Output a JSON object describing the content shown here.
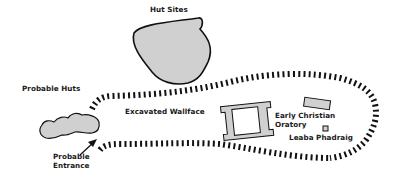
{
  "diagram": {
    "type": "site-plan",
    "colors": {
      "fill": "#d0d0d0",
      "stroke": "#111111",
      "wall_dash": "#111111",
      "background": "#ffffff"
    },
    "labels": {
      "hut_sites": "Hut Sites",
      "probable_huts": "Probable Huts",
      "excavated_wallface": "Excavated Wallface",
      "early_christian_oratory_line1": "Early Christian",
      "early_christian_oratory_line2": "Oratory",
      "leaba_phadraig": "Leaba Phadraig",
      "probable_entrance_line1": "Probable",
      "probable_entrance_line2": "Entrance"
    },
    "features": [
      {
        "name": "hut-sites",
        "shape": "blob"
      },
      {
        "name": "probable-huts",
        "shape": "blob"
      },
      {
        "name": "enclosure-wall",
        "shape": "dashed-oval"
      },
      {
        "name": "oratory-building",
        "shape": "rectangle-with-interior"
      },
      {
        "name": "rectangular-structure",
        "shape": "rectangle"
      },
      {
        "name": "leaba-phadraig",
        "shape": "small-square"
      },
      {
        "name": "entrance-arrow",
        "shape": "arrow"
      }
    ]
  }
}
